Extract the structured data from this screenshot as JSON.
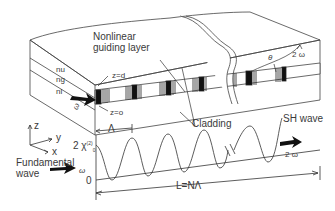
{
  "diagram": {
    "labels": {
      "nonlinear_layer_line1": "Nonlinear",
      "nonlinear_layer_line2": "guiding layer",
      "n_upper": "nu",
      "n_guide": "ng",
      "n_lower": "nl",
      "z_d": "z=d",
      "z_0": "z=o",
      "omega_input": "ω",
      "theta": "θ",
      "two_omega_top": "2 ω",
      "cladding": "Cladding",
      "axis_z": "z",
      "axis_y": "y",
      "axis_x": "x",
      "lambda": "Λ",
      "chi_label": "2 χ",
      "chi_sup": "(2)",
      "chi_sub": "0",
      "zero": "0",
      "fundamental_line1": "Fundamental",
      "fundamental_line2": "wave",
      "omega_fund": "ω",
      "sh_wave": "SH wave",
      "two_omega_out": "2 ω",
      "length": "L=NΛ"
    }
  }
}
